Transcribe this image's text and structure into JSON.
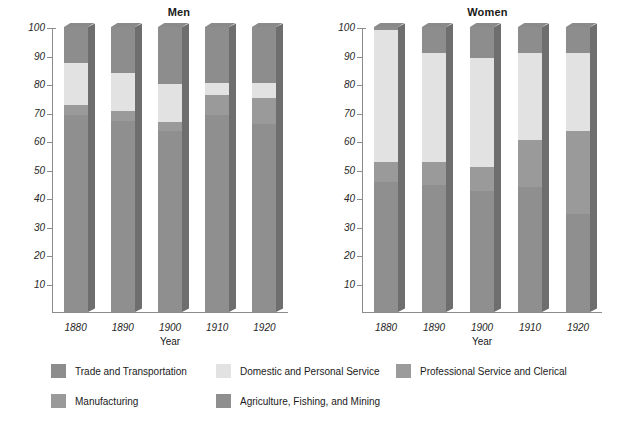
{
  "chart_data": {
    "type": "bar",
    "subtype": "stacked-bar-100-percent",
    "title": "",
    "panels": [
      {
        "title": "Men",
        "ylabel": "Percentage of All Men Working",
        "xlabel": "Year",
        "categories": [
          "1880",
          "1890",
          "1900",
          "1910",
          "1920"
        ],
        "ylim": [
          0,
          100
        ],
        "yticks": [
          10,
          20,
          30,
          40,
          50,
          60,
          70,
          80,
          90,
          100
        ],
        "grid": false,
        "series": [
          {
            "name": "Agriculture, Fishing, and Mining",
            "values": [
              69,
              67,
              63.5,
              69,
              66
            ]
          },
          {
            "name": "Manufacturing",
            "values": [
              3.5,
              3.5,
              3,
              7,
              9
            ]
          },
          {
            "name": "Domestic and Personal Service",
            "values": [
              15,
              13.5,
              13.5,
              4.5,
              5.5
            ]
          },
          {
            "name": "Trade and Transportation",
            "values": [
              12.5,
              16,
              20,
              19.5,
              19.5
            ]
          },
          {
            "name": "Professional Service and Clerical",
            "values": [
              0,
              0,
              0,
              0,
              0
            ]
          }
        ]
      },
      {
        "title": "Women",
        "ylabel": "Percentage of All Women Working",
        "xlabel": "Year",
        "categories": [
          "1880",
          "1890",
          "1900",
          "1910",
          "1920"
        ],
        "ylim": [
          0,
          100
        ],
        "yticks": [
          10,
          20,
          30,
          40,
          50,
          60,
          70,
          80,
          90,
          100
        ],
        "grid": false,
        "series": [
          {
            "name": "Agriculture, Fishing, and Mining",
            "values": [
              45.5,
              44.5,
              42.5,
              44,
              34.5
            ]
          },
          {
            "name": "Manufacturing",
            "values": [
              7,
              8,
              8.5,
              16.5,
              29
            ]
          },
          {
            "name": "Domestic and Personal Service",
            "values": [
              46.5,
              38.5,
              38,
              30.5,
              27.5
            ]
          },
          {
            "name": "Trade and Transportation",
            "values": [
              1,
              9,
              11,
              9,
              9
            ]
          },
          {
            "name": "Professional Service and Clerical",
            "values": [
              0,
              0,
              0,
              0,
              0
            ]
          }
        ]
      }
    ],
    "legend": {
      "position": "bottom",
      "entries": [
        {
          "label": "Trade and Transportation",
          "color": "#8d8d8d"
        },
        {
          "label": "Domestic and Personal Service",
          "color": "#e2e2e2"
        },
        {
          "label": "Professional Service and Clerical",
          "color": "#9b9b9b"
        },
        {
          "label": "Manufacturing",
          "color": "#9a9a9a"
        },
        {
          "label": "Agriculture, Fishing, and Mining",
          "color": "#8f8f8f"
        }
      ]
    },
    "colors": {
      "trade_and_transportation": "#8d8d8d",
      "domestic_and_personal_service": "#e2e2e2",
      "professional_service_and_clerical": "#9b9b9b",
      "manufacturing": "#9a9a9a",
      "agriculture_fishing_and_mining": "#8f8f8f",
      "axis": "#8c8c8c",
      "text": "#1a1a1a",
      "background": "#ffffff"
    }
  }
}
